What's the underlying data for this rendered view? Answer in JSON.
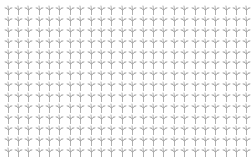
{
  "pattern": {
    "glyph": "bare-tree-icon",
    "columns": 24,
    "rows": 14,
    "background": "#ffffff",
    "glyph_color": "#8a8a8a"
  }
}
